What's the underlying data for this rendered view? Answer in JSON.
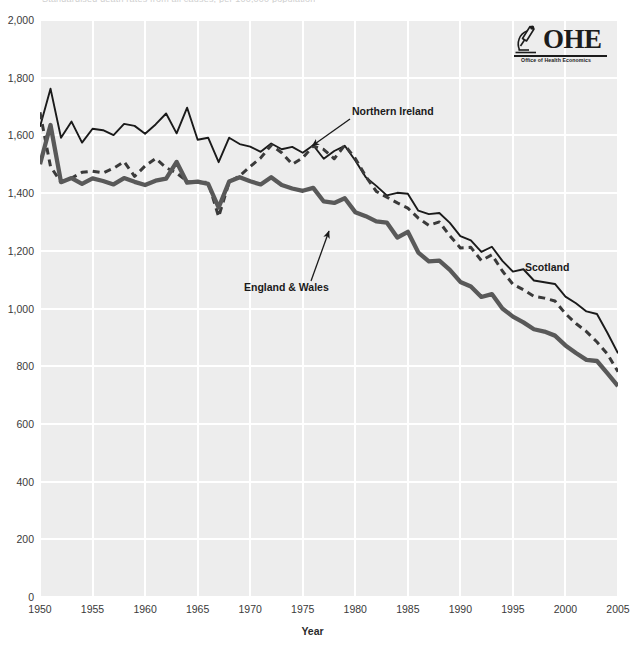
{
  "chart_data": {
    "type": "line",
    "title": "Standardised death rates from all causes, per 100,000 population",
    "xlabel": "Year",
    "ylabel": "",
    "xlim": [
      1950,
      2005
    ],
    "ylim": [
      0,
      2000
    ],
    "grid": true,
    "legend_position": "inline-annotations",
    "xticks": [
      "1950",
      "1955",
      "1960",
      "1965",
      "1970",
      "1975",
      "1980",
      "1985",
      "1990",
      "1995",
      "2000",
      "2005"
    ],
    "yticks": [
      "0",
      "200",
      "400",
      "600",
      "800",
      "1,000",
      "1,200",
      "1,400",
      "1,600",
      "1,800",
      "2,000"
    ],
    "x": [
      1950,
      1951,
      1952,
      1953,
      1954,
      1955,
      1956,
      1957,
      1958,
      1959,
      1960,
      1961,
      1962,
      1963,
      1964,
      1965,
      1966,
      1967,
      1968,
      1969,
      1970,
      1971,
      1972,
      1973,
      1974,
      1975,
      1976,
      1977,
      1978,
      1979,
      1980,
      1981,
      1982,
      1983,
      1984,
      1985,
      1986,
      1987,
      1988,
      1989,
      1990,
      1991,
      1992,
      1993,
      1994,
      1995,
      1996,
      1997,
      1998,
      1999,
      2000,
      2001,
      2002,
      2003,
      2004,
      2005
    ],
    "series": [
      {
        "name": "Scotland",
        "style": "solid-thin",
        "color": "#1a1a1a",
        "values": [
          1630,
          1762,
          1592,
          1648,
          1575,
          1623,
          1618,
          1601,
          1640,
          1633,
          1606,
          1638,
          1676,
          1607,
          1696,
          1585,
          1592,
          1507,
          1592,
          1570,
          1561,
          1543,
          1572,
          1552,
          1560,
          1540,
          1566,
          1519,
          1546,
          1564,
          1513,
          1455,
          1425,
          1392,
          1401,
          1398,
          1339,
          1327,
          1331,
          1297,
          1251,
          1236,
          1196,
          1214,
          1165,
          1128,
          1136,
          1097,
          1091,
          1085,
          1041,
          1018,
          990,
          981,
          915,
          845
        ]
      },
      {
        "name": "Northern Ireland",
        "style": "dashed",
        "color": "#3a3a3a",
        "values": [
          1680,
          1492,
          1438,
          1452,
          1472,
          1476,
          1470,
          1486,
          1509,
          1458,
          1494,
          1520,
          1488,
          1470,
          1440,
          1435,
          1438,
          1318,
          1438,
          1460,
          1492,
          1522,
          1566,
          1540,
          1500,
          1522,
          1563,
          1551,
          1519,
          1566,
          1520,
          1458,
          1406,
          1386,
          1366,
          1348,
          1313,
          1288,
          1300,
          1252,
          1210,
          1212,
          1166,
          1186,
          1130,
          1084,
          1065,
          1042,
          1036,
          1026,
          982,
          948,
          920,
          884,
          842,
          781
        ]
      },
      {
        "name": "England & Wales",
        "style": "solid-thick",
        "color": "#595959",
        "values": [
          1500,
          1636,
          1438,
          1452,
          1432,
          1451,
          1442,
          1430,
          1452,
          1439,
          1428,
          1443,
          1450,
          1508,
          1436,
          1440,
          1432,
          1350,
          1440,
          1455,
          1441,
          1430,
          1455,
          1428,
          1416,
          1408,
          1418,
          1371,
          1366,
          1382,
          1334,
          1320,
          1302,
          1298,
          1246,
          1266,
          1194,
          1163,
          1166,
          1134,
          1092,
          1076,
          1040,
          1050,
          1000,
          972,
          952,
          928,
          920,
          906,
          872,
          846,
          822,
          818,
          775,
          731
        ]
      }
    ],
    "annotations": [
      {
        "text": "Northern Ireland",
        "target_series": "Northern Ireland"
      },
      {
        "text": "England & Wales",
        "target_series": "England & Wales"
      },
      {
        "text": "Scotland",
        "target_series": "Scotland"
      }
    ]
  },
  "logo": {
    "mark": "OHE",
    "subtitle": "Office of Health Economics",
    "icon": "microscope-icon"
  },
  "colors": {
    "plot_background": "#ededed",
    "gridline": "#ffffff",
    "page_background": "#ffffff",
    "text": "#333333"
  }
}
